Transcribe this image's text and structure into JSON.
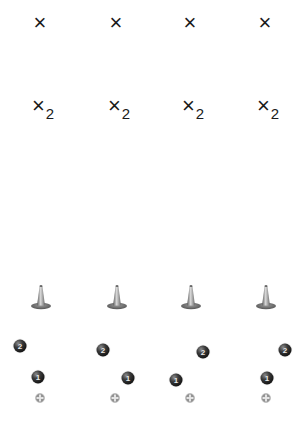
{
  "diagram": {
    "columns": [
      {
        "id": 1,
        "x_label": "×",
        "x2_label": {
          "base": "×",
          "subscript": "2"
        },
        "cone": "cone-icon",
        "ball_2": {
          "label": "2",
          "pos": [
            20,
            346
          ]
        },
        "ball_1": {
          "label": "1",
          "pos": [
            38,
            377
          ]
        },
        "marker": {
          "pos": [
            40,
            398
          ]
        },
        "center_x": 40
      },
      {
        "id": 2,
        "x_label": "×",
        "x2_label": {
          "base": "×",
          "subscript": "2"
        },
        "cone": "cone-icon",
        "ball_2": {
          "label": "2",
          "pos": [
            103,
            350
          ]
        },
        "ball_1": {
          "label": "1",
          "pos": [
            128,
            378
          ]
        },
        "marker": {
          "pos": [
            115,
            398
          ]
        },
        "center_x": 116
      },
      {
        "id": 3,
        "x_label": "×",
        "x2_label": {
          "base": "×",
          "subscript": "2"
        },
        "cone": "cone-icon",
        "ball_2": {
          "label": "2",
          "pos": [
            203,
            352
          ]
        },
        "ball_1": {
          "label": "1",
          "pos": [
            176,
            380
          ]
        },
        "marker": {
          "pos": [
            190,
            398
          ]
        },
        "center_x": 190
      },
      {
        "id": 4,
        "x_label": "×",
        "x2_label": {
          "base": "×",
          "subscript": "2"
        },
        "cone": "cone-icon",
        "ball_2": {
          "label": "2",
          "pos": [
            285,
            350
          ]
        },
        "ball_1": {
          "label": "1",
          "pos": [
            267,
            378
          ]
        },
        "marker": {
          "pos": [
            266,
            398
          ]
        },
        "center_x": 265
      }
    ],
    "rows_y": {
      "x_label": 23,
      "x2_label": 107,
      "cone_top": 284
    },
    "colors": {
      "text": "#1a1a1a",
      "ball": "#111111",
      "ball_text": "#e8e8e8",
      "cone_body": "#9a9a9a",
      "cone_base": "#707070",
      "marker": "#9c9c9c",
      "background": "#ffffff"
    }
  }
}
